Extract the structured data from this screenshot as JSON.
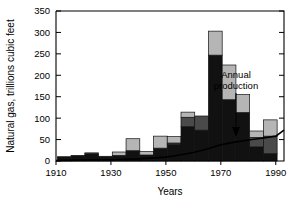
{
  "chart_data": {
    "type": "bar",
    "title": "",
    "xlabel": "Years",
    "ylabel": "Natural gas, trillions cubic feet",
    "xlim": [
      1910,
      1993
    ],
    "ylim": [
      0,
      350
    ],
    "xticks": [
      1910,
      1930,
      1950,
      1970,
      1990
    ],
    "xticklabels": [
      "1910",
      "1930",
      "1950",
      "1970",
      "1990"
    ],
    "yticks": [
      0,
      50,
      100,
      150,
      200,
      250,
      300,
      350
    ],
    "yticklabels": [
      "0",
      "50",
      "100",
      "150",
      "200",
      "250",
      "300",
      "350"
    ],
    "grid": false,
    "legend_position": "none",
    "stacked": true,
    "bar_width_years": 5,
    "categories": [
      1913,
      1918,
      1923,
      1928,
      1933,
      1938,
      1943,
      1948,
      1953,
      1958,
      1963,
      1968,
      1973,
      1978,
      1983,
      1988
    ],
    "series": [
      {
        "name": "lower-segment",
        "color": "#111111",
        "values": [
          10,
          13,
          18,
          11,
          13,
          24,
          14,
          30,
          38,
          80,
          72,
          247,
          143,
          113,
          33,
          17
        ]
      },
      {
        "name": "middle-segment",
        "color": "#4a4a4a",
        "values": [
          0,
          0,
          0,
          0,
          0,
          0,
          0,
          0,
          4,
          22,
          33,
          0,
          0,
          0,
          22,
          41
        ]
      },
      {
        "name": "upper-segment",
        "color": "#b5b5b5",
        "values": [
          0,
          0,
          1,
          0,
          8,
          28,
          8,
          28,
          15,
          12,
          0,
          56,
          81,
          42,
          15,
          38
        ]
      }
    ],
    "bar_totals": [
      10,
      13,
      19,
      11,
      21,
      52,
      22,
      58,
      57,
      114,
      105,
      303,
      224,
      155,
      70,
      96
    ],
    "annotations": [
      {
        "name": "annual-production",
        "text_line1": "Annual",
        "text_line2": "production",
        "points_to_year": 1987,
        "points_to_value": 62
      }
    ],
    "production_line": {
      "name": "Annual production",
      "x": [
        1910,
        1920,
        1930,
        1940,
        1950,
        1955,
        1960,
        1965,
        1970,
        1975,
        1980,
        1985,
        1990,
        1993
      ],
      "y": [
        1,
        2,
        3,
        5,
        9,
        14,
        20,
        28,
        38,
        44,
        49,
        53,
        58,
        72
      ],
      "color": "#000000"
    },
    "shading_note": "Stacked bars: black lower, dark-gray middle, light-gray upper"
  },
  "colors": {
    "axis": "#000000",
    "background": "#ffffff",
    "seg_dark": "#111111",
    "seg_mid": "#4a4a4a",
    "seg_light": "#b5b5b5"
  }
}
